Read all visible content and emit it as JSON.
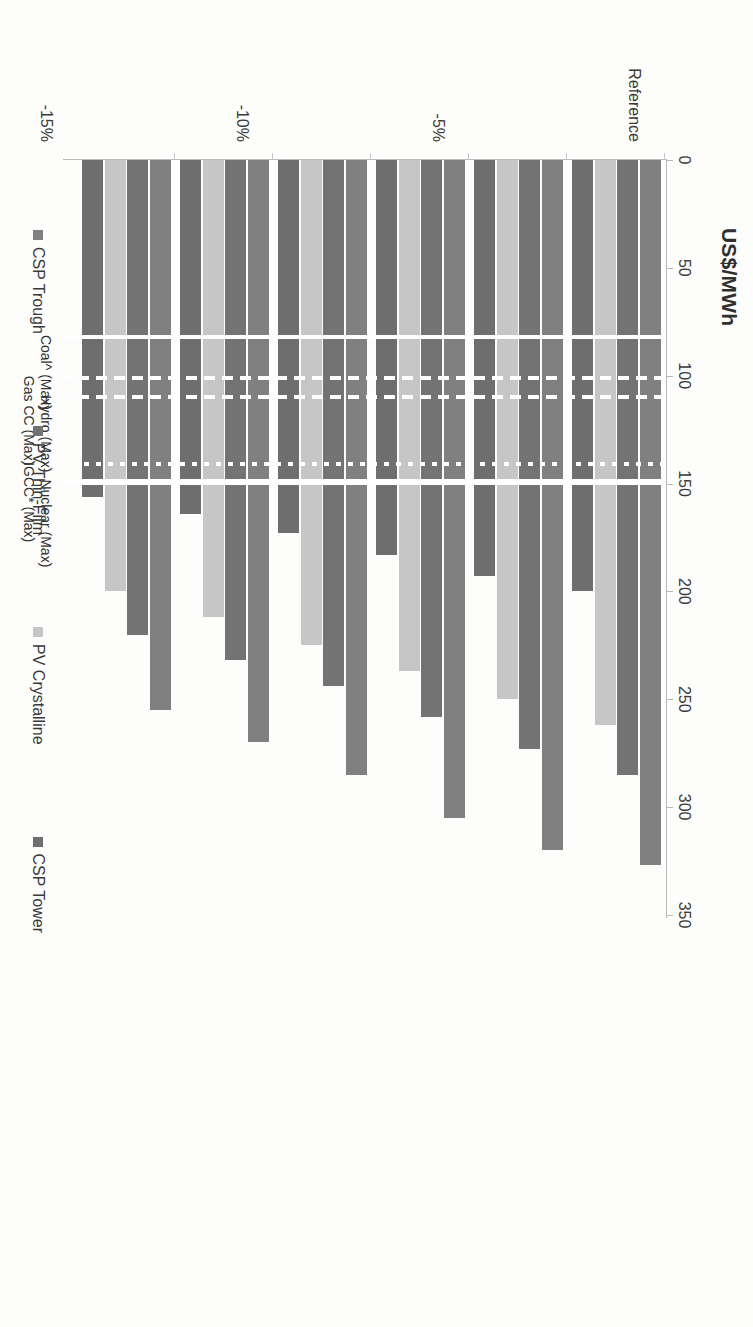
{
  "chart_data": {
    "type": "bar",
    "orientation": "horizontal-grouped",
    "title": "",
    "xlabel": "US$/MWh",
    "ylabel": "",
    "xlim": [
      0,
      350
    ],
    "xticks": [
      0,
      50,
      100,
      150,
      200,
      250,
      300,
      350
    ],
    "grid": false,
    "legend_position": "bottom",
    "categories": [
      "Reference",
      "-5%",
      "-10%",
      "-15%",
      "-20%",
      "-25%"
    ],
    "series": [
      {
        "name": "CSP Trough",
        "color": "#808080",
        "values": [
          327,
          320,
          305,
          285,
          270,
          255
        ]
      },
      {
        "name": "PV Thin-Film",
        "color": "#737373",
        "values": [
          285,
          273,
          258,
          244,
          232,
          220
        ]
      },
      {
        "name": "PV Crystalline",
        "color": "#c6c6c6",
        "values": [
          262,
          250,
          237,
          225,
          212,
          200
        ]
      },
      {
        "name": "CSP Tower",
        "color": "#6e6e6e",
        "values": [
          200,
          193,
          183,
          173,
          164,
          156
        ]
      }
    ],
    "reference_lines": [
      {
        "label": "Coal^ (Max)",
        "value": 82,
        "style": "solid"
      },
      {
        "label": "Gas CC (Max)",
        "value": 101,
        "style": "dash"
      },
      {
        "label": "Hydro (Max)",
        "value": 110,
        "style": "dash"
      },
      {
        "label": "IGCC* (Max)",
        "value": 141,
        "style": "dot"
      },
      {
        "label": "Nuclear (Max)",
        "value": 149,
        "style": "thick"
      }
    ]
  },
  "axis": {
    "title": "US$/MWh",
    "tick_labels": [
      "0",
      "50",
      "100",
      "150",
      "200",
      "250",
      "300",
      "350"
    ]
  },
  "legend": {
    "items": [
      {
        "label": "CSP Trough"
      },
      {
        "label": "PV Thin-Film"
      },
      {
        "label": "PV Crystalline"
      },
      {
        "label": "CSP Tower"
      }
    ]
  },
  "category_labels": [
    "Reference",
    "-5%",
    "-10%",
    "-15%",
    "-20%",
    "-25%"
  ],
  "reference_labels": [
    "Nuclear (Max)",
    "IGCC* (Max)",
    "Hydro (Max)",
    "Gas CC (Max)",
    "Coal^ (Max)"
  ]
}
